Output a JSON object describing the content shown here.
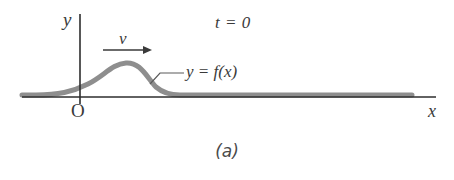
{
  "figure": {
    "caption": "(a)",
    "background_color": "#ffffff"
  },
  "axes": {
    "x_label": "x",
    "y_label": "y",
    "origin_label": "O",
    "axis_color": "#2e2e2e",
    "x_axis_y": 97,
    "x_axis_start": 22,
    "x_axis_end": 436,
    "y_axis_x": 80,
    "y_axis_top": 14,
    "y_axis_bottom": 104
  },
  "annotations": {
    "time_label": "t = 0",
    "velocity_label": "v",
    "function_label": "y = f(x)",
    "leader_line_color": "#5a5a5a",
    "arrow_color": "#3a3a3a"
  },
  "pulse": {
    "stroke_color": "#8e8e8e",
    "stroke_width": 5,
    "baseline_y": 97,
    "peak_x": 126,
    "peak_y": 63,
    "amplitude": 34,
    "start_x": 22,
    "end_x": 412,
    "path": "M 22 95 L 36 95 C 58 95 72 92 88 84 C 104 76 112 64 126 63 C 140 62 146 76 156 87 C 163 93 170 95 180 95 L 412 95"
  },
  "velocity_arrow": {
    "x_start": 103,
    "x_end": 152,
    "y": 50
  },
  "leader_line": {
    "x_start": 152,
    "x_end": 184,
    "y": 73,
    "curve_anchor_x": 152,
    "curve_anchor_y": 82
  },
  "chart_data": {
    "type": "line",
    "title": "(a)",
    "xlabel": "x",
    "ylabel": "y",
    "series": [
      {
        "name": "y = f(x)",
        "description": "Asymmetric transverse wave pulse on a string at t = 0, travelling in the +x direction with speed v",
        "x": [
          0,
          10,
          20,
          30,
          40,
          50,
          60,
          70,
          80,
          90,
          100,
          110,
          120,
          130
        ],
        "y": [
          0,
          0,
          1,
          4,
          11,
          22,
          32,
          34,
          26,
          12,
          3,
          0,
          0,
          0
        ]
      }
    ],
    "annotations": [
      "t = 0",
      "v",
      "y = f(x)",
      "O"
    ],
    "grid": false,
    "legend": "none"
  }
}
